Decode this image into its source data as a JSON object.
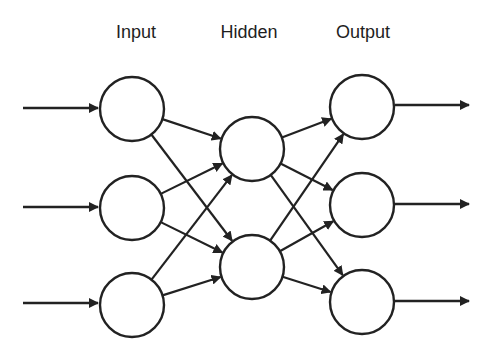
{
  "diagram": {
    "stroke_color": "#222222",
    "background": "#ffffff",
    "layers": [
      {
        "id": "input",
        "label": "Input",
        "label_x": 136,
        "nodes": [
          {
            "id": "i1",
            "cx": 132,
            "cy": 109
          },
          {
            "id": "i2",
            "cx": 132,
            "cy": 208
          },
          {
            "id": "i3",
            "cx": 132,
            "cy": 305
          }
        ]
      },
      {
        "id": "hidden",
        "label": "Hidden",
        "label_x": 249,
        "nodes": [
          {
            "id": "h1",
            "cx": 252,
            "cy": 149
          },
          {
            "id": "h2",
            "cx": 252,
            "cy": 267
          }
        ]
      },
      {
        "id": "output",
        "label": "Output",
        "label_x": 363,
        "nodes": [
          {
            "id": "o1",
            "cx": 362,
            "cy": 107
          },
          {
            "id": "o2",
            "cx": 362,
            "cy": 205
          },
          {
            "id": "o3",
            "cx": 362,
            "cy": 302
          }
        ]
      }
    ],
    "node_radius": 32,
    "input_arrows": [
      {
        "x1": 23,
        "y": 108,
        "x2": 98
      },
      {
        "x1": 23,
        "y": 207,
        "x2": 98
      },
      {
        "x1": 23,
        "y": 303,
        "x2": 98
      }
    ],
    "output_arrows": [
      {
        "x1": 395,
        "y": 105,
        "x2": 469
      },
      {
        "x1": 395,
        "y": 204,
        "x2": 469
      },
      {
        "x1": 395,
        "y": 301,
        "x2": 469
      }
    ],
    "edges": [
      {
        "from": "i1",
        "to": "h1"
      },
      {
        "from": "i1",
        "to": "h2"
      },
      {
        "from": "i2",
        "to": "h1"
      },
      {
        "from": "i2",
        "to": "h2"
      },
      {
        "from": "i3",
        "to": "h1"
      },
      {
        "from": "i3",
        "to": "h2"
      },
      {
        "from": "h1",
        "to": "o1"
      },
      {
        "from": "h1",
        "to": "o2"
      },
      {
        "from": "h1",
        "to": "o3"
      },
      {
        "from": "h2",
        "to": "o1"
      },
      {
        "from": "h2",
        "to": "o2"
      },
      {
        "from": "h2",
        "to": "o3"
      }
    ]
  }
}
